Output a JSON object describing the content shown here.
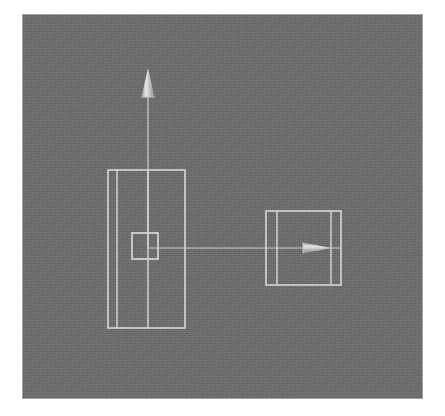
{
  "app": {
    "title": "3D Viewport",
    "view_label": "Front"
  },
  "viewport": {
    "background_color": "#6e6e6e",
    "wire_color": "#d8d8d8",
    "page_background": "#ffffff",
    "width": 401,
    "height": 385,
    "left": 22,
    "top": 14
  },
  "objects": [
    {
      "id": "tall-box",
      "name": "Tall Box Wireframe",
      "type": "box-wireframe",
      "x": 108,
      "y": 170,
      "width": 77,
      "height": 158,
      "inner_vertical_lines": [
        9,
        40
      ],
      "selected": false
    },
    {
      "id": "selection-square",
      "name": "Selection Handle Square",
      "type": "square",
      "x": 132,
      "y": 233,
      "width": 26,
      "height": 26,
      "selected": true
    },
    {
      "id": "up-gizmo",
      "name": "Up Direction Gizmo",
      "type": "arrow",
      "direction": "up",
      "tail_x": 148,
      "tail_y": 248,
      "head_x": 148,
      "head_y": 68,
      "cone_length": 29,
      "cone_width": 13
    },
    {
      "id": "target-box",
      "name": "Target Box Wireframe",
      "type": "box-wireframe",
      "x": 266,
      "y": 211,
      "width": 75,
      "height": 74,
      "inner_vertical_lines": [
        11,
        65
      ],
      "selected": false
    },
    {
      "id": "right-gizmo",
      "name": "Right Direction Gizmo",
      "type": "arrow",
      "direction": "right",
      "tail_x": 158,
      "tail_y": 248,
      "head_x": 331,
      "head_y": 248,
      "cone_length": 28,
      "cone_width": 11
    }
  ],
  "connector": {
    "name": "Link Line",
    "from_x": 148,
    "from_y": 248,
    "to_x": 341,
    "to_y": 248
  },
  "statusbar": {
    "text": ""
  }
}
